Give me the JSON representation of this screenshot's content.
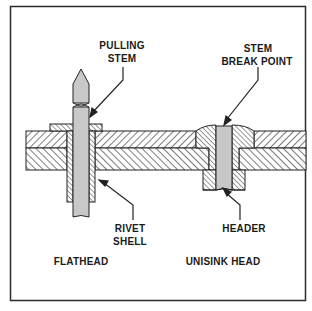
{
  "figure": {
    "type": "cross-section diagram",
    "colors": {
      "frame": "#2a2a2a",
      "stroke": "#222222",
      "hatch": "#333333",
      "stem_fill": "#c8c8c8",
      "background": "#ffffff"
    }
  },
  "labels": {
    "pulling_stem": [
      "PULLING",
      "STEM"
    ],
    "stem_break_point": [
      "STEM",
      "BREAK POINT"
    ],
    "rivet_shell": [
      "RIVET",
      "SHELL"
    ],
    "header": "HEADER",
    "flathead": "FLATHEAD",
    "unisink_head": "UNISINK HEAD"
  }
}
